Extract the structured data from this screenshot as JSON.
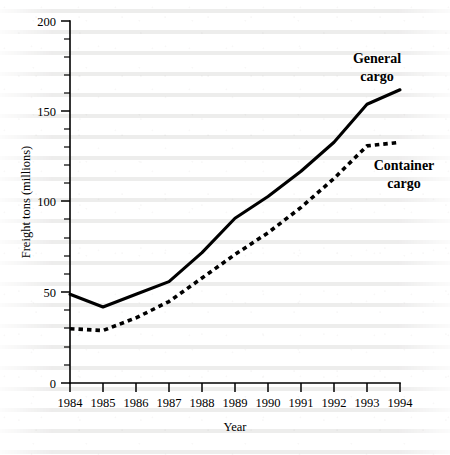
{
  "chart_data": {
    "type": "line",
    "title": "",
    "xlabel": "Year",
    "ylabel": "Freight tons (millions)",
    "x": [
      1984,
      1985,
      1986,
      1987,
      1988,
      1989,
      1990,
      1991,
      1992,
      1993,
      1994
    ],
    "xtick_labels": [
      "1984",
      "1985",
      "1986",
      "1987",
      "1988",
      "1989",
      "1990",
      "1991",
      "1992",
      "1993",
      "1994"
    ],
    "ytick_labels": [
      "0",
      "50",
      "100",
      "150",
      "200"
    ],
    "yticks": [
      0,
      50,
      100,
      150,
      200
    ],
    "y_minor_step": 10,
    "ylim": [
      0,
      200
    ],
    "xlim": [
      1984,
      1994
    ],
    "grid": false,
    "legend_position": "inline-right",
    "series": [
      {
        "name": "General cargo",
        "style": "solid",
        "color": "#000000",
        "values": [
          49,
          42,
          49,
          56,
          72,
          91,
          103,
          117,
          133,
          154,
          162
        ],
        "label_line1": "General",
        "label_line2": "cargo"
      },
      {
        "name": "Container cargo",
        "style": "dotted",
        "color": "#000000",
        "values": [
          30,
          29,
          36,
          45,
          58,
          71,
          83,
          97,
          113,
          131,
          133
        ],
        "label_line1": "Container",
        "label_line2": "cargo"
      }
    ]
  }
}
